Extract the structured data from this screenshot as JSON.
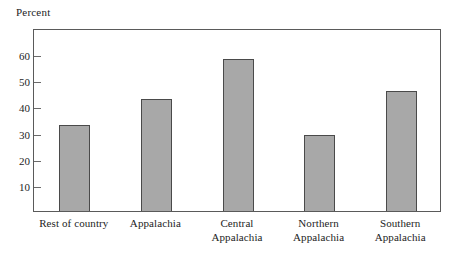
{
  "chart_data": {
    "type": "bar",
    "title": "",
    "subtitle": "",
    "xlabel": "",
    "ylabel": "Percent",
    "ylim": [
      0,
      70
    ],
    "yticks": [
      10,
      20,
      30,
      40,
      50,
      60
    ],
    "ytick_labels": [
      "10",
      "20",
      "30",
      "40",
      "50",
      "60"
    ],
    "grid": false,
    "legend": false,
    "legend_position": "none",
    "categories": [
      "Rest of country",
      "Appalachia",
      "Central\nAppalachia",
      "Northern\nAppalachia",
      "Southern\nAppalachia"
    ],
    "values": [
      33,
      43,
      58,
      29,
      46
    ],
    "bar_color": "#a8a8a8",
    "bar_edge_color": "#4a4a4a",
    "frame_color": "#5a5a5a",
    "background_color": "#ffffff"
  },
  "axis": {
    "y_caption": "Percent"
  }
}
